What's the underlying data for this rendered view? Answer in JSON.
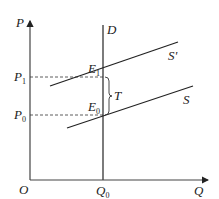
{
  "diagram": {
    "type": "supply-demand-tax",
    "axes": {
      "y_label": "P",
      "x_label": "Q",
      "origin_label": "O"
    },
    "price_levels": [
      {
        "label": "P",
        "sub": "1"
      },
      {
        "label": "P",
        "sub": "0"
      }
    ],
    "quantity_levels": [
      {
        "label": "Q",
        "sub": "0"
      }
    ],
    "curves": {
      "demand": "D",
      "supply_original": "S",
      "supply_shifted": "S'"
    },
    "equilibria": [
      {
        "label": "E",
        "sub": "1"
      },
      {
        "label": "E",
        "sub": "0"
      }
    ],
    "tax_label": "T",
    "colors": {
      "line": "#222222",
      "background": "#ffffff"
    }
  }
}
